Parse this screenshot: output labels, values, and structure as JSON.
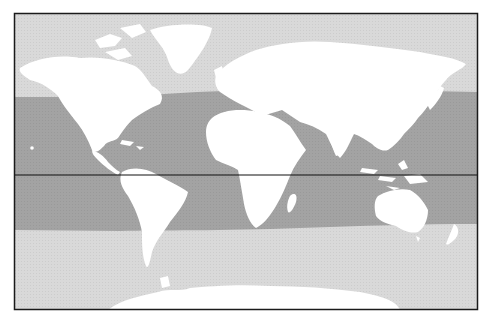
{
  "map": {
    "title": "",
    "projection": "equirectangular-like world map",
    "frame": {
      "x": 14,
      "y": 13,
      "width": 464,
      "height": 297
    },
    "equator_y": 175,
    "colors": {
      "ocean": "#d9d9d9",
      "tropical_band": "#a3a3a3",
      "land": "#ffffff",
      "frame": "#1a1a1a",
      "equator": "#111111"
    },
    "layers": [
      {
        "name": "ocean-background",
        "description": "light gray ocean outside the tropical zone"
      },
      {
        "name": "tropical-band",
        "description": "darker gray band spanning roughly 30°N to 30°S across the oceans"
      },
      {
        "name": "equator-line",
        "description": "horizontal black line across the map"
      },
      {
        "name": "landmasses",
        "description": "continents rendered in white"
      }
    ],
    "landmasses": [
      "North America",
      "Greenland",
      "South America",
      "Europe",
      "Asia",
      "Africa",
      "Madagascar",
      "Australia",
      "New Zealand",
      "Antarctica",
      "Japan",
      "Indonesia",
      "Caribbean",
      "Hawaii"
    ]
  }
}
